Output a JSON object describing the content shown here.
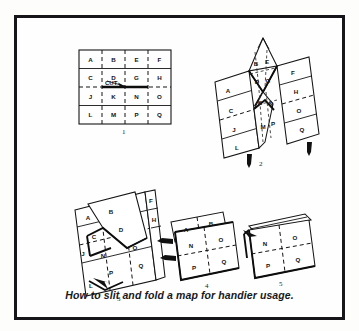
{
  "figure": {
    "caption": "How to slit and fold a map for handier usage.",
    "border_color": "#16161a",
    "background_color": "#fdfdfc",
    "ink_color": "#141414"
  },
  "steps": [
    {
      "number": "1",
      "name": "flat-map-with-cut",
      "description": "Flat 4x4 map grid with a slit (CUT) across the middle two center panels",
      "grid": {
        "rows": 4,
        "cols": 4,
        "cells": [
          [
            "A",
            "B",
            "E",
            "F"
          ],
          [
            "C",
            "D",
            "G",
            "H"
          ],
          [
            "J",
            "K",
            "N",
            "O"
          ],
          [
            "L",
            "M",
            "P",
            "Q"
          ]
        ]
      },
      "cut_label": "CUT"
    },
    {
      "number": "2",
      "name": "pinch-center-panels",
      "description": "Center panels pinched upward into a peak while the outer panels stay flat",
      "cells": [
        "A",
        "B",
        "E",
        "F",
        "C",
        "D",
        "G",
        "H",
        "J",
        "K",
        "M",
        "N",
        "O",
        "L",
        "P",
        "Q"
      ]
    },
    {
      "number": "3",
      "name": "fold-flaps-over",
      "description": "Panels folded over so the slit opens and flaps swing across",
      "cells": [
        "A",
        "B",
        "F",
        "C",
        "D",
        "H",
        "N",
        "O",
        "J",
        "P",
        "Q",
        "L"
      ]
    },
    {
      "number": "4",
      "name": "fold-remaining-flap",
      "description": "Remaining A-B flap folded back against the N O P Q block",
      "cells": [
        "A",
        "B",
        "N",
        "O",
        "P",
        "Q"
      ]
    },
    {
      "number": "5",
      "name": "finished-packet",
      "description": "Finished compact packet showing N O P Q on the face",
      "cells": [
        "N",
        "O",
        "P",
        "Q"
      ]
    }
  ]
}
